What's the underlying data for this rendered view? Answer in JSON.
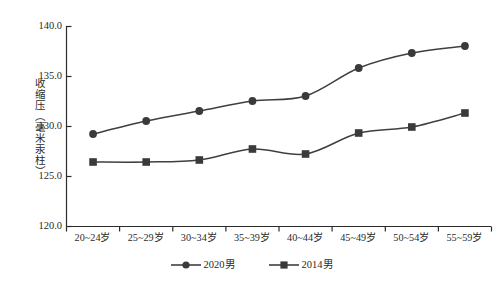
{
  "chart_data": {
    "type": "line",
    "title": "",
    "subtitle": "",
    "xlabel": "",
    "ylabel": "收缩压（毫米汞柱）",
    "categories": [
      "20~24岁",
      "25~29岁",
      "30~34岁",
      "35~39岁",
      "40~44岁",
      "45~49岁",
      "50~54岁",
      "55~59岁"
    ],
    "series": [
      {
        "name": "2020男",
        "marker": "circle",
        "color": "#3a3a3a",
        "values": [
          129.2,
          130.5,
          131.5,
          132.5,
          133.0,
          135.8,
          137.3,
          138.0
        ]
      },
      {
        "name": "2014男",
        "marker": "square",
        "color": "#3a3a3a",
        "values": [
          126.4,
          126.4,
          126.6,
          127.7,
          127.2,
          129.3,
          129.9,
          131.3
        ]
      }
    ],
    "ylim": [
      120.0,
      140.0
    ],
    "ytick_labels": [
      "140.0",
      "135.0",
      "130.0",
      "125.0",
      "120.0"
    ],
    "ytick_values": [
      140.0,
      135.0,
      130.0,
      125.0,
      120.0
    ],
    "grid": false,
    "legend_position": "bottom"
  },
  "legend": {
    "entries": [
      {
        "label": "2020男",
        "marker": "circle"
      },
      {
        "label": "2014男",
        "marker": "square"
      }
    ]
  },
  "colors": {
    "axis": "#2b2b2b",
    "line": "#3f3f3f",
    "marker": "#3a3a3a",
    "background": "#ffffff"
  }
}
